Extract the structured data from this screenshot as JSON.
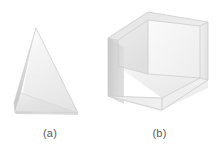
{
  "figure": {
    "background_color": "#ffffff",
    "caption_color": "#5a5a5a",
    "items": [
      {
        "label": "(a)",
        "object_name": "tetrahedral-prism",
        "description": "triangular pyramid glass prism",
        "faces": [
          {
            "name": "front-upper-face",
            "color": "#f2f2f2"
          },
          {
            "name": "front-lower-face",
            "color": "#e2e2e2"
          },
          {
            "name": "left-sliver-face",
            "color": "#c3c3c3"
          },
          {
            "name": "right-face",
            "color": "#ededed"
          }
        ],
        "edge_color": "#c9c9c9"
      },
      {
        "label": "(b)",
        "object_name": "cubic-prism",
        "description": "cube shaped glass prism",
        "faces": [
          {
            "name": "left-face",
            "color": "#d2d2d2"
          },
          {
            "name": "right-face",
            "color": "#ebebeb"
          },
          {
            "name": "inner-back-left",
            "color": "#e8e8e8"
          },
          {
            "name": "inner-back-right",
            "color": "#f4f4f4"
          },
          {
            "name": "bottom-inner-face",
            "color": "#efefef"
          },
          {
            "name": "top-rim-face",
            "color": "#e6e6e6"
          }
        ],
        "edge_color": "#c9c9c9"
      }
    ]
  }
}
